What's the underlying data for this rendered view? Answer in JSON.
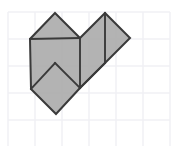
{
  "figure": {
    "background_color": "#ffffff",
    "canvas": {
      "width": 186,
      "height": 146
    },
    "grid": {
      "line_color": "#f0f0f4",
      "line_width": 1.4,
      "cell_size": 27,
      "origin_x": 8,
      "origin_y": 12,
      "columns": 6,
      "rows": 5,
      "x_positions": [
        8,
        35,
        62,
        89,
        116,
        143,
        170
      ],
      "y_positions": [
        12,
        39,
        66,
        93,
        120,
        147
      ],
      "visible": true
    },
    "shape": {
      "name": "four-rotated-squares-polyomino",
      "fill_color": "#a9a9a9",
      "fill_opacity": 0.88,
      "stroke_color": "#3a3a3a",
      "stroke_width": 2.0,
      "square_count": 4,
      "rotation_degrees": 45,
      "square_side_px": 35.4,
      "interior_line_color": "#3a3a3a",
      "interior_line_width": 1.9,
      "outline_points": "55,13 80,38 105,13 130,38 81,88 81,88 56,114 31,89 31,89 30,39",
      "outline_polygon": [
        [
          55,
          13
        ],
        [
          80,
          38
        ],
        [
          105,
          13
        ],
        [
          130,
          38
        ],
        [
          80,
          88
        ],
        [
          56,
          114
        ],
        [
          31,
          89
        ],
        [
          30,
          39
        ]
      ],
      "interior_edges": [
        {
          "name": "diag-center-left",
          "x1": 80,
          "y1": 38,
          "x2": 30,
          "y2": 39
        },
        {
          "name": "diag-center-down",
          "x1": 80,
          "y1": 38,
          "x2": 80,
          "y2": 88
        },
        {
          "name": "diag-lower-left",
          "x1": 55,
          "y1": 63,
          "x2": 31,
          "y2": 89
        },
        {
          "name": "diag-lower-cross",
          "x1": 55,
          "y1": 63,
          "x2": 80,
          "y2": 88
        },
        {
          "name": "diag-right-upper",
          "x1": 105,
          "y1": 63,
          "x2": 105,
          "y2": 13
        },
        {
          "name": "diag-right-lower",
          "x1": 105,
          "y1": 63,
          "x2": 80,
          "y2": 88
        }
      ],
      "cells": [
        {
          "name": "square-top-left",
          "points": "55,13 80,38 55,63 30,39"
        },
        {
          "name": "square-top-right",
          "points": "105,13 130,38 105,63 80,38"
        },
        {
          "name": "square-center",
          "points": "80,38 105,63 80,88 55,63"
        },
        {
          "name": "square-bottom-left",
          "points": "55,63 80,88 56,114 31,89"
        }
      ]
    }
  }
}
